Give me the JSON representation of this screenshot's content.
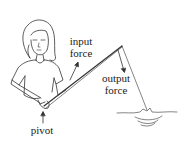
{
  "diagram": {
    "labels": {
      "input_force_line1": "input",
      "input_force_line2": "force",
      "output_force_line1": "output",
      "output_force_line2": "force",
      "pivot": "pivot"
    },
    "colors": {
      "stroke": "#333333",
      "background": "#ffffff"
    }
  }
}
